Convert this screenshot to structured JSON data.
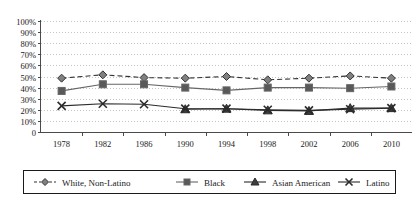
{
  "chart_data": {
    "type": "line",
    "title": "",
    "xlabel": "",
    "ylabel": "",
    "grid": true,
    "legend_position": "bottom",
    "ylim": [
      0,
      100
    ],
    "ytick_labels": [
      "100%",
      "90%",
      "80%",
      "70%",
      "60%",
      "50%",
      "40%",
      "30%",
      "20%",
      "10%",
      "0"
    ],
    "ytick_values": [
      100,
      90,
      80,
      70,
      60,
      50,
      40,
      30,
      20,
      10,
      0
    ],
    "categories": [
      "1978",
      "1982",
      "1986",
      "1990",
      "1994",
      "1998",
      "2002",
      "2006",
      "2010"
    ],
    "x": [
      1978,
      1982,
      1986,
      1990,
      1994,
      1998,
      2002,
      2006,
      2010
    ],
    "series": [
      {
        "name": "White, Non-Latino",
        "marker": "diamond",
        "line_style": "dashed",
        "color": "#333333",
        "marker_fill": "#808080",
        "values": [
          48.5,
          51.5,
          49.0,
          48.5,
          50.0,
          47.0,
          48.5,
          50.5,
          48.5
        ]
      },
      {
        "name": "Black",
        "marker": "square",
        "line_style": "solid",
        "color": "#666666",
        "marker_fill": "#595959",
        "values": [
          37.0,
          43.0,
          43.0,
          40.0,
          37.5,
          40.0,
          40.0,
          39.5,
          41.0
        ]
      },
      {
        "name": "Asian American",
        "marker": "triangle",
        "line_style": "solid",
        "color": "#2b2b2b",
        "marker_fill": "#3d3d3d",
        "values": [
          null,
          null,
          null,
          20.5,
          21.0,
          19.5,
          19.0,
          21.5,
          21.5
        ]
      },
      {
        "name": "Latino",
        "marker": "x",
        "line_style": "solid",
        "color": "#2b2b2b",
        "marker_fill": "#2b2b2b",
        "values": [
          23.5,
          25.5,
          25.0,
          21.0,
          21.0,
          20.0,
          19.5,
          20.5,
          21.5
        ]
      }
    ]
  },
  "legend": {
    "items": [
      {
        "label": "White, Non-Latino"
      },
      {
        "label": "Black"
      },
      {
        "label": "Asian American"
      },
      {
        "label": "Latino"
      }
    ]
  }
}
